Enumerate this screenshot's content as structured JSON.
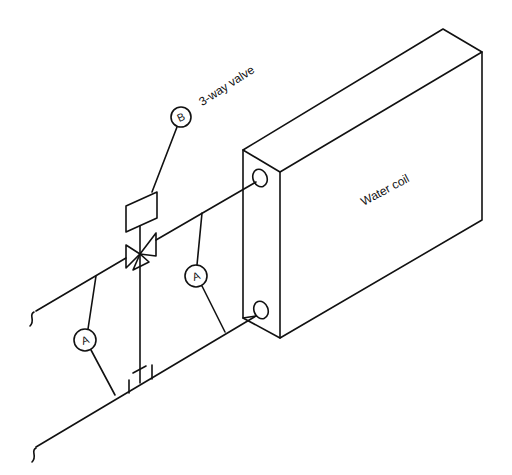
{
  "diagram": {
    "type": "isometric piping schematic",
    "components": {
      "coil": {
        "label": "Water coil"
      },
      "valve": {
        "label": "3-way valve",
        "callout": "B"
      },
      "sensors": [
        {
          "callout": "A",
          "position": "left, between supply and return pipes"
        },
        {
          "callout": "A",
          "position": "right, between supply and return pipes near coil"
        }
      ]
    },
    "pipes": [
      {
        "name": "upper pipe",
        "connects": "break symbol to coil upper port via 3-way valve"
      },
      {
        "name": "lower pipe",
        "connects": "break symbol to coil lower port"
      }
    ],
    "colors": {
      "line": "#111111",
      "background": "#ffffff"
    }
  },
  "labels": {
    "coil": "Water coil",
    "valve": "3-way valve",
    "callout_b": "B",
    "callout_a_left": "A",
    "callout_a_right": "A"
  }
}
